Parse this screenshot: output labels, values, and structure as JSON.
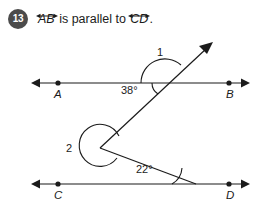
{
  "question": {
    "number": "13",
    "text_before": "",
    "line1_label": "AB",
    "text_middle": " is parallel to ",
    "line2_label": "CD",
    "text_after": "."
  },
  "figure": {
    "type": "geometry-diagram",
    "points": [
      {
        "name": "A",
        "x": 58,
        "y": 83
      },
      {
        "name": "B",
        "x": 229,
        "y": 83
      },
      {
        "name": "C",
        "x": 58,
        "y": 184
      },
      {
        "name": "D",
        "x": 229,
        "y": 184
      }
    ],
    "lines": [
      {
        "name": "line-AB",
        "x1": 33,
        "y1": 83,
        "x2": 248,
        "y2": 83
      },
      {
        "name": "line-CD",
        "x1": 33,
        "y1": 184,
        "x2": 248,
        "y2": 184
      }
    ],
    "rays": [
      {
        "name": "ray-upper",
        "x1": 100,
        "y1": 148,
        "x2": 212,
        "y2": 44
      },
      {
        "name": "ray-lower",
        "x1": 100,
        "y1": 148,
        "x2": 196,
        "y2": 184
      }
    ],
    "angles": [
      {
        "name": "angle-1",
        "label": "1",
        "x": 157,
        "y": 52
      },
      {
        "name": "angle-38",
        "label": "38°",
        "x": 124,
        "y": 84
      },
      {
        "name": "angle-2",
        "label": "2",
        "x": 67,
        "y": 143
      },
      {
        "name": "angle-22",
        "label": "22°",
        "x": 138,
        "y": 163
      }
    ],
    "colors": {
      "stroke": "#1b1b1b",
      "badge_bg": "#4b4b4b",
      "badge_text": "#ffffff",
      "background": "#ffffff"
    }
  }
}
